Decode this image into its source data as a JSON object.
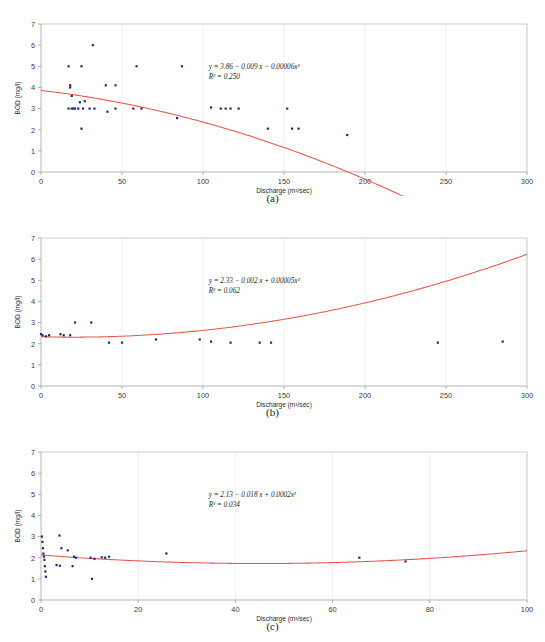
{
  "figure": {
    "panels": [
      {
        "id": "a",
        "caption": "(a)",
        "equation": "y = 3.86 − 0.009 x − 0.00006x²",
        "r_squared_label": "R² = 0.250",
        "chart_data": {
          "type": "scatter",
          "title": "",
          "xlabel": "Discharge (m³/sec)",
          "ylabel": "BOD (mg/l)",
          "xlim": [
            0,
            300
          ],
          "ylim": [
            0,
            7
          ],
          "xticks": [
            0,
            50,
            100,
            150,
            200,
            250,
            300
          ],
          "yticks": [
            0,
            1,
            2,
            3,
            4,
            5,
            6,
            7
          ],
          "grid": true,
          "legend": "none",
          "fit": {
            "kind": "quadratic",
            "intercept": 3.86,
            "linear": -0.009,
            "quadratic": -6e-05,
            "r_squared": 0.25,
            "color": "#e8564b"
          },
          "points": [
            [
              17,
              5.0
            ],
            [
              25,
              5.0
            ],
            [
              32,
              6.0
            ],
            [
              59,
              5.0
            ],
            [
              87,
              5.0
            ],
            [
              18,
              4.1
            ],
            [
              18,
              4.0
            ],
            [
              40,
              4.1
            ],
            [
              46,
              4.1
            ],
            [
              19,
              3.6
            ],
            [
              24,
              3.3
            ],
            [
              27,
              3.35
            ],
            [
              30,
              3.0
            ],
            [
              17,
              3.0
            ],
            [
              19,
              3.0
            ],
            [
              20,
              3.0
            ],
            [
              21,
              3.0
            ],
            [
              23,
              3.0
            ],
            [
              26,
              3.0
            ],
            [
              33,
              3.0
            ],
            [
              41,
              2.85
            ],
            [
              46,
              3.0
            ],
            [
              57,
              3.0
            ],
            [
              62,
              3.0
            ],
            [
              84,
              2.55
            ],
            [
              105,
              3.05
            ],
            [
              111,
              3.0
            ],
            [
              114,
              3.0
            ],
            [
              117,
              3.0
            ],
            [
              122,
              3.0
            ],
            [
              152,
              3.0
            ],
            [
              25,
              2.05
            ],
            [
              140,
              2.05
            ],
            [
              155,
              2.05
            ],
            [
              159,
              2.05
            ],
            [
              189,
              1.75
            ]
          ],
          "point_color": "#232c6e"
        }
      },
      {
        "id": "b",
        "caption": "(b)",
        "equation": "y = 2.33 − 0.002 x + 0.00005x²",
        "r_squared_label": "R² = 0.062",
        "chart_data": {
          "type": "scatter",
          "title": "",
          "xlabel": "Discharge (m³/sec)",
          "ylabel": "BOD (mg/l)",
          "xlim": [
            0,
            300
          ],
          "ylim": [
            0,
            7
          ],
          "xticks": [
            0,
            50,
            100,
            150,
            200,
            250,
            300
          ],
          "yticks": [
            0,
            1,
            2,
            3,
            4,
            5,
            6,
            7
          ],
          "grid": true,
          "legend": "none",
          "fit": {
            "kind": "quadratic",
            "intercept": 2.33,
            "linear": -0.002,
            "quadratic": 5e-05,
            "r_squared": 0.062,
            "color": "#e8564b"
          },
          "points": [
            [
              0,
              2.45
            ],
            [
              1,
              2.4
            ],
            [
              3,
              2.35
            ],
            [
              5,
              2.4
            ],
            [
              12,
              2.45
            ],
            [
              14,
              2.4
            ],
            [
              18,
              2.4
            ],
            [
              21,
              3.0
            ],
            [
              31,
              3.0
            ],
            [
              42,
              2.05
            ],
            [
              50,
              2.05
            ],
            [
              71,
              2.2
            ],
            [
              98,
              2.2
            ],
            [
              105,
              2.1
            ],
            [
              117,
              2.05
            ],
            [
              135,
              2.05
            ],
            [
              142,
              2.05
            ],
            [
              245,
              2.05
            ],
            [
              285,
              2.1
            ]
          ],
          "point_color": "#232c6e"
        }
      },
      {
        "id": "c",
        "caption": "(c)",
        "equation": "y = 2.13 − 0.018 x + 0.0002x²",
        "r_squared_label": "R² = 0.034",
        "chart_data": {
          "type": "scatter",
          "title": "",
          "xlabel": "Discharge (m³/sec)",
          "ylabel": "BOD (mg/l)",
          "xlim": [
            0,
            100
          ],
          "ylim": [
            0,
            7
          ],
          "xticks": [
            0,
            20,
            40,
            60,
            80,
            100
          ],
          "yticks": [
            0,
            1,
            2,
            3,
            4,
            5,
            6,
            7
          ],
          "grid": true,
          "legend": "none",
          "fit": {
            "kind": "quadratic",
            "intercept": 2.13,
            "linear": -0.018,
            "quadratic": 0.0002,
            "r_squared": 0.034,
            "color": "#e8564b"
          },
          "points": [
            [
              0.2,
              3.0
            ],
            [
              0.3,
              2.75
            ],
            [
              0.4,
              2.45
            ],
            [
              0.5,
              2.2
            ],
            [
              0.6,
              2.05
            ],
            [
              0.7,
              1.9
            ],
            [
              0.8,
              1.6
            ],
            [
              0.9,
              1.35
            ],
            [
              1.0,
              1.1
            ],
            [
              3.8,
              3.05
            ],
            [
              4.2,
              2.45
            ],
            [
              5.5,
              2.35
            ],
            [
              3.2,
              1.65
            ],
            [
              3.9,
              1.62
            ],
            [
              6.5,
              1.6
            ],
            [
              6.8,
              2.05
            ],
            [
              7.2,
              2.0
            ],
            [
              10.2,
              2.0
            ],
            [
              11.0,
              1.95
            ],
            [
              12.5,
              2.02
            ],
            [
              13.2,
              2.0
            ],
            [
              14.0,
              2.05
            ],
            [
              10.5,
              1.0
            ],
            [
              25.8,
              2.2
            ],
            [
              65.5,
              2.0
            ],
            [
              75.0,
              1.82
            ]
          ],
          "point_color": "#232c6e"
        }
      }
    ]
  }
}
